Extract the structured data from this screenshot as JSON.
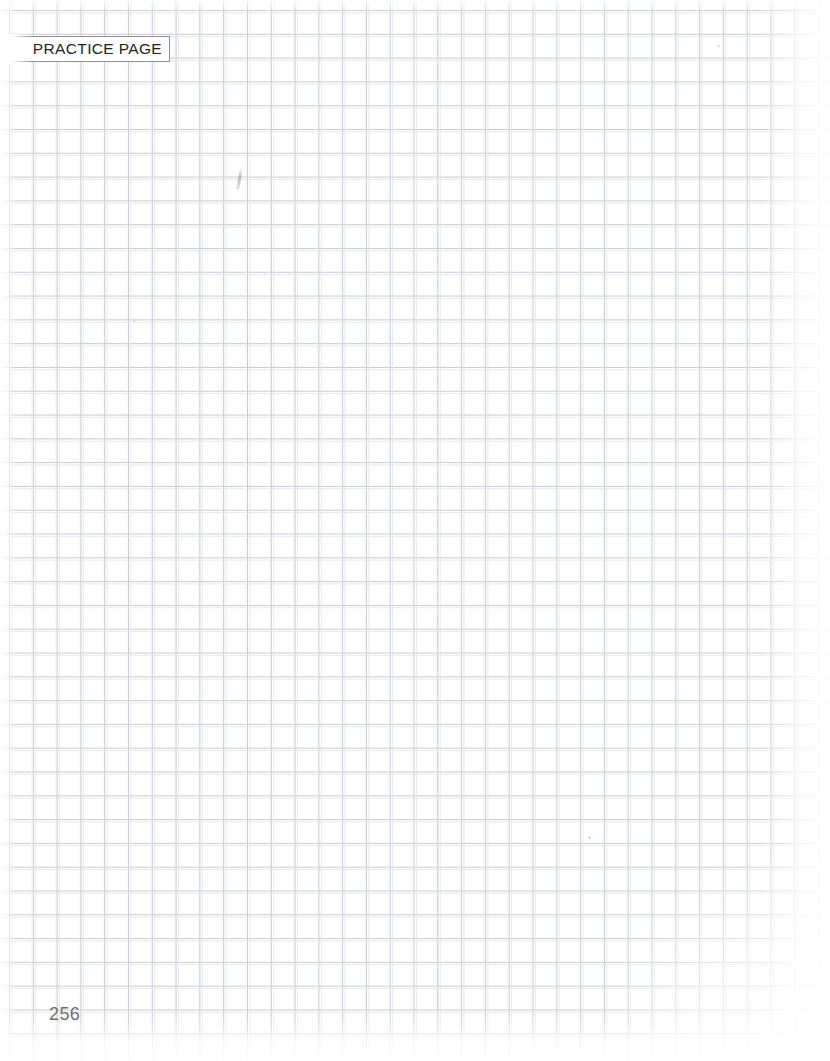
{
  "page": {
    "kind": "graph-paper-practice-page",
    "width": 830,
    "height": 1061,
    "background_color": "#ffffff"
  },
  "tab": {
    "label": "PRACTICE PAGE",
    "text_color": "#231f20",
    "background_color": "#ffffff",
    "border_color": "#8e9096"
  },
  "footer": {
    "page_number": "256",
    "text_color": "#6e6e72"
  },
  "grid": {
    "cell_size_px": 23.8,
    "line_color": "#c3c5cb",
    "ghost_line_color": "#dfe1e6",
    "origin_x_px": 9,
    "origin_y_px": 10
  },
  "marks": {
    "pencil_stroke": "faint-pencil-stroke",
    "specks": [
      "speck-a",
      "speck-b",
      "speck-c"
    ]
  }
}
